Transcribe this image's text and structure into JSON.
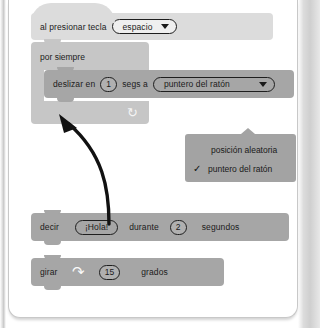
{
  "app": {
    "name": "Scratch block editor (grayscale print)"
  },
  "script": {
    "hat": {
      "label": "al presionar tecla",
      "dropdown_value": "espacio",
      "dropdown_icon": "chevron-down-icon"
    },
    "forever": {
      "label": "por siempre",
      "loop_icon": "loop-arrow-icon"
    },
    "glide": {
      "label_1": "deslizar en",
      "seconds_value": "1",
      "label_2": "segs a",
      "target_value": "puntero del ratón",
      "dropdown_icon": "chevron-down-icon"
    },
    "say": {
      "label_1": "decir",
      "message_value": "¡Hola!",
      "label_2": "durante",
      "seconds_value": "2",
      "label_3": "segundos"
    },
    "turn": {
      "label_1": "girar",
      "direction_icon": "turn-clockwise-icon",
      "degrees_value": "15",
      "label_2": "grados"
    }
  },
  "dropdown_menu": {
    "options": [
      {
        "label": "posición aleatoria",
        "checked": false
      },
      {
        "label": "puntero del ratón",
        "checked": true
      }
    ],
    "check_icon": "check-icon"
  },
  "annotation": {
    "arrow_icon": "curved-arrow-icon"
  },
  "colors": {
    "block_dark": "#a6a6a6",
    "block_mid": "#c6c6c6",
    "block_light": "#dcdcdc",
    "menu_bg": "#a3a3a3",
    "text": "#1b1b1b",
    "page_bg": "#ffffff"
  }
}
